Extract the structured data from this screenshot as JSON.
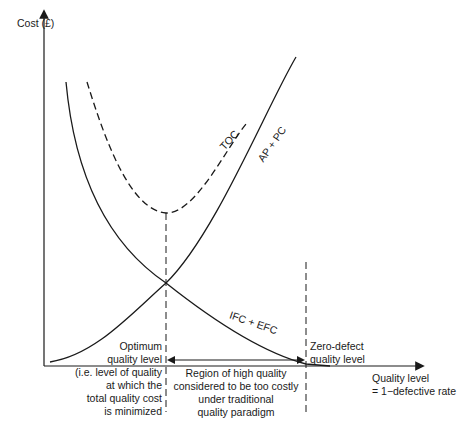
{
  "diagram": {
    "y_axis_label": "Cost (£)",
    "x_axis_label_line1": "Quality level",
    "x_axis_label_line2": "= 1−defective rate",
    "curves": {
      "toc": "TOC",
      "ap_pc": "AP + PC",
      "ifc_efc": "IFC + EFC"
    },
    "optimum": {
      "lines": [
        "Optimum",
        "quality level",
        "(i.e. level of quality",
        "at which the",
        "total quality cost",
        "is minimized"
      ]
    },
    "zero_defect": {
      "lines": [
        "Zero-defect",
        "quality level"
      ]
    },
    "region": {
      "lines": [
        "Region of high quality",
        "considered to be too costly",
        "under traditional",
        "quality paradigm"
      ]
    },
    "colors": {
      "line": "#1a1a1a",
      "background": "#ffffff"
    }
  }
}
